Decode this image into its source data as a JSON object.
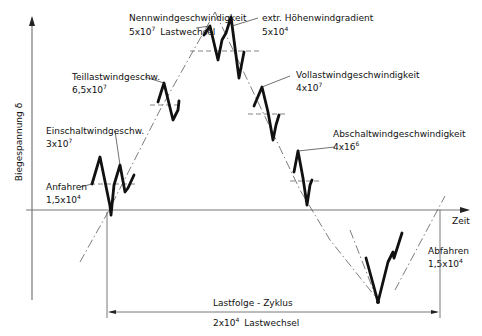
{
  "diagram": {
    "y_axis_label": "Biegespannung δ",
    "x_axis_label": "Zeit",
    "annotations": [
      {
        "id": "nennwind",
        "label": "Nennwindgeschwindigkeit",
        "value_base": "5x10",
        "value_exp": "7",
        "value_suffix": "Lastwechsel"
      },
      {
        "id": "hoehenwind",
        "label": "extr. Höhenwindgradient",
        "value_base": "5x10",
        "value_exp": "4",
        "value_suffix": ""
      },
      {
        "id": "teillast",
        "label": "Teillastwindgeschw.",
        "value_base": "6,5x10",
        "value_exp": "7",
        "value_suffix": ""
      },
      {
        "id": "vollast",
        "label": "Vollastwindgeschwindigkeit",
        "value_base": "4x10",
        "value_exp": "7",
        "value_suffix": ""
      },
      {
        "id": "einschalt",
        "label": "Einschaltwindgeschw.",
        "value_base": "3x10",
        "value_exp": "7",
        "value_suffix": ""
      },
      {
        "id": "abschalt",
        "label": "Abschaltwindgeschwindigkeit",
        "value_base": "4x16",
        "value_exp": "6",
        "value_suffix": ""
      },
      {
        "id": "anfahren",
        "label": "Anfahren",
        "value_base": "1,5x10",
        "value_exp": "4",
        "value_suffix": ""
      },
      {
        "id": "abfahren",
        "label": "Abfahren",
        "value_base": "1,5x10",
        "value_exp": "4",
        "value_suffix": ""
      }
    ],
    "cycle": {
      "label": "Lastfolge - Zyklus",
      "value_base": "2x10",
      "value_exp": "4",
      "value_suffix": "Lastwechsel"
    }
  }
}
